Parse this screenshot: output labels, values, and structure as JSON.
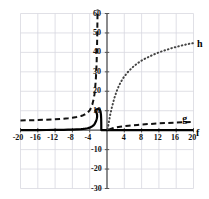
{
  "chart_data": {
    "type": "line",
    "title": "",
    "subtitle": "",
    "xlabel": "",
    "ylabel": "",
    "xlim": [
      -20,
      20
    ],
    "ylim": [
      -30,
      60
    ],
    "grid": true,
    "grid_step_x": 4,
    "grid_step_y": 10,
    "legend_position": "inline-right",
    "x_ticks": [
      {
        "value": -20,
        "label": "-20"
      },
      {
        "value": -16,
        "label": "-16"
      },
      {
        "value": -12,
        "label": "-12"
      },
      {
        "value": -8,
        "label": "-8"
      },
      {
        "value": -4,
        "label": "-4"
      },
      {
        "value": 4,
        "label": "4"
      },
      {
        "value": 8,
        "label": "8"
      },
      {
        "value": 12,
        "label": "12"
      },
      {
        "value": 16,
        "label": "16"
      },
      {
        "value": 20,
        "label": "20"
      }
    ],
    "y_ticks": [
      {
        "value": 60,
        "label": "60"
      },
      {
        "value": 50,
        "label": "50"
      },
      {
        "value": 40,
        "label": "40"
      },
      {
        "value": 30,
        "label": "30"
      },
      {
        "value": 20,
        "label": "20"
      },
      {
        "value": 10,
        "label": "10"
      },
      {
        "value": -10,
        "label": "-10"
      },
      {
        "value": -20,
        "label": "-20"
      },
      {
        "value": -30,
        "label": "-30"
      }
    ],
    "series": [
      {
        "name": "f",
        "label": "f",
        "style": "solid",
        "color": "#000000",
        "width": 2.2,
        "label_x": 20.6,
        "label_y": -1.6,
        "points": [
          [
            -20,
            0.02
          ],
          [
            -18,
            0.03
          ],
          [
            -16,
            0.05
          ],
          [
            -14,
            0.08
          ],
          [
            -12,
            0.13
          ],
          [
            -10,
            0.2
          ],
          [
            -9,
            0.26
          ],
          [
            -8,
            0.33
          ],
          [
            -7,
            0.42
          ],
          [
            -6,
            0.55
          ],
          [
            -5.5,
            0.65
          ],
          [
            -5,
            0.8
          ],
          [
            -4.5,
            1.0
          ],
          [
            -4,
            1.3
          ],
          [
            -3.6,
            1.7
          ],
          [
            -3.2,
            2.3
          ],
          [
            -3,
            2.8
          ],
          [
            -2.8,
            3.4
          ],
          [
            -2.6,
            4.3
          ],
          [
            -2.45,
            5.2
          ],
          [
            -2.35,
            6.0
          ],
          [
            -2.3,
            6.6
          ],
          [
            -2.28,
            7.2
          ],
          [
            -2.3,
            8.0
          ],
          [
            -2.4,
            8.8
          ],
          [
            -2.55,
            9.4
          ],
          [
            -2.7,
            9.9
          ],
          [
            -2.6,
            10.4
          ],
          [
            -2.3,
            10.8
          ],
          [
            -2.0,
            10.9
          ],
          [
            -1.7,
            10.6
          ],
          [
            -1.5,
            9.6
          ],
          [
            -1.4,
            8.0
          ],
          [
            -1.35,
            6.0
          ],
          [
            -1.33,
            4.0
          ],
          [
            -1.32,
            2.0
          ],
          [
            -1.32,
            0.6
          ],
          [
            -1.3,
            0.05
          ],
          [
            0,
            0
          ],
          [
            4,
            0
          ],
          [
            8,
            0
          ],
          [
            12,
            0
          ],
          [
            16,
            0
          ],
          [
            20,
            0
          ]
        ]
      },
      {
        "name": "g",
        "label": "g",
        "style": "dashed",
        "color": "#111111",
        "width": 2.0,
        "label_x": 17.4,
        "label_y": 5.6,
        "points": [
          [
            -20,
            5.0
          ],
          [
            -18,
            5.1
          ],
          [
            -16,
            5.2
          ],
          [
            -14,
            5.4
          ],
          [
            -12,
            5.6
          ],
          [
            -10,
            5.9
          ],
          [
            -9,
            6.1
          ],
          [
            -8,
            6.4
          ],
          [
            -7,
            6.8
          ],
          [
            -6,
            7.3
          ],
          [
            -5.5,
            7.7
          ],
          [
            -5,
            8.2
          ],
          [
            -4.5,
            9.0
          ],
          [
            -4,
            10.2
          ],
          [
            -3.7,
            11.4
          ],
          [
            -3.4,
            13.2
          ],
          [
            -3.1,
            15.8
          ],
          [
            -2.9,
            18.4
          ],
          [
            -2.75,
            21.5
          ],
          [
            -2.6,
            25.5
          ],
          [
            -2.5,
            29.5
          ],
          [
            -2.4,
            34.5
          ],
          [
            -2.33,
            40.0
          ],
          [
            -2.28,
            46.0
          ],
          [
            -2.24,
            52.0
          ],
          [
            -2.2,
            58.0
          ],
          [
            -2.18,
            62.0
          ]
        ],
        "points_right": [
          [
            0.4,
            0.2
          ],
          [
            1,
            0.7
          ],
          [
            1.5,
            1.1
          ],
          [
            2,
            1.4
          ],
          [
            3,
            1.8
          ],
          [
            4,
            2.1
          ],
          [
            5,
            2.3
          ],
          [
            6,
            2.5
          ],
          [
            7,
            2.7
          ],
          [
            8,
            2.9
          ],
          [
            10,
            3.2
          ],
          [
            12,
            3.5
          ],
          [
            14,
            3.7
          ],
          [
            16,
            3.9
          ],
          [
            18,
            4.1
          ],
          [
            20,
            4.2
          ]
        ]
      },
      {
        "name": "h",
        "label": "h",
        "style": "dotted",
        "color": "#444444",
        "width": 2.0,
        "label_x": 20.8,
        "label_y": 44.5,
        "points": [
          [
            0.15,
            0.5
          ],
          [
            0.3,
            2.5
          ],
          [
            0.5,
            5.0
          ],
          [
            0.7,
            7.5
          ],
          [
            0.9,
            9.5
          ],
          [
            1.1,
            11.5
          ],
          [
            1.4,
            14.0
          ],
          [
            1.7,
            16.5
          ],
          [
            2,
            18.5
          ],
          [
            2.4,
            21.0
          ],
          [
            2.8,
            23.0
          ],
          [
            3.2,
            24.8
          ],
          [
            3.6,
            26.3
          ],
          [
            4,
            27.6
          ],
          [
            4.6,
            29.3
          ],
          [
            5.2,
            30.8
          ],
          [
            6,
            32.5
          ],
          [
            7,
            34.3
          ],
          [
            8,
            35.8
          ],
          [
            9,
            37.0
          ],
          [
            10,
            38.1
          ],
          [
            11,
            39.1
          ],
          [
            12,
            40.0
          ],
          [
            13,
            40.8
          ],
          [
            14,
            41.5
          ],
          [
            15,
            42.2
          ],
          [
            16,
            42.8
          ],
          [
            17,
            43.4
          ],
          [
            18,
            43.9
          ],
          [
            19,
            44.4
          ],
          [
            20,
            44.8
          ]
        ]
      }
    ],
    "colors": {
      "grid": "#d8d8e0",
      "axis": "#555555",
      "background": "#ffffff",
      "text": "#111111"
    }
  }
}
